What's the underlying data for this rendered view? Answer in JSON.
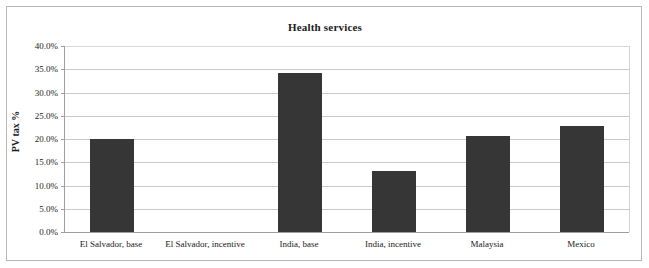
{
  "chart_data": {
    "type": "bar",
    "title": "Health services",
    "xlabel": "",
    "ylabel": "PV tax %",
    "ylim": [
      0,
      40
    ],
    "ytick_labels": [
      "40.0%",
      "35.0%",
      "30.0%",
      "25.0%",
      "20.0%",
      "15.0%",
      "10.0%",
      "5.0%",
      "0.0%"
    ],
    "ytick_values": [
      40,
      35,
      30,
      25,
      20,
      15,
      10,
      5,
      0
    ],
    "grid": true,
    "legend": "none",
    "categories": [
      "El Salvador, base",
      "El Salvador, incentive",
      "India, base",
      "India, incentive",
      "Malaysia",
      "Mexico"
    ],
    "values": [
      20.0,
      0.0,
      34.3,
      13.1,
      20.6,
      22.7
    ],
    "bar_color": "#363636",
    "plot_border_color": "#b6b6b6",
    "gridline_color": "#c9c9c9"
  }
}
